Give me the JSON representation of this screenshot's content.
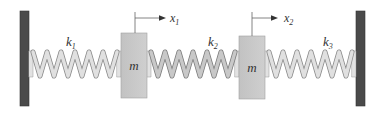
{
  "diagram": {
    "type": "two-mass spring system",
    "colors": {
      "wall": "#4a4a4a",
      "mass": "#c9c9c9",
      "mass_stroke": "#9a9a9a",
      "spring_fill": "#dcdcdc",
      "spring_stroke": "#8c8c8c",
      "text": "#333333",
      "arrow": "#444444"
    },
    "walls": [
      {
        "id": "left-wall"
      },
      {
        "id": "right-wall"
      }
    ],
    "springs": [
      {
        "label": "k",
        "sub": "1"
      },
      {
        "label": "k",
        "sub": "2"
      },
      {
        "label": "k",
        "sub": "3"
      }
    ],
    "masses": [
      {
        "label": "m",
        "displacement": {
          "label": "x",
          "sub": "1"
        }
      },
      {
        "label": "m",
        "displacement": {
          "label": "x",
          "sub": "2"
        }
      }
    ]
  }
}
